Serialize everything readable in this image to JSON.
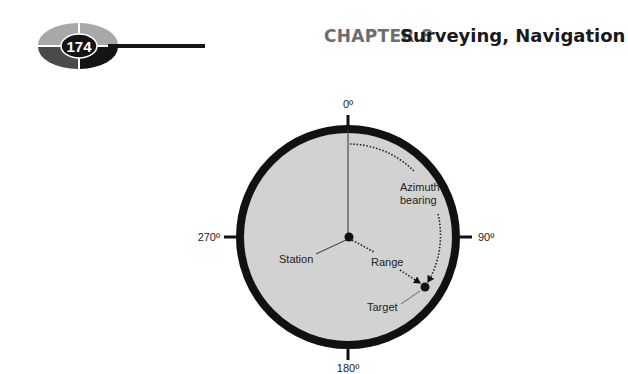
{
  "header": {
    "page_number": "174",
    "chapter_label": "CHAPTER 8",
    "chapter_title": "Surveying, Navigation"
  },
  "figure": {
    "compass_labels": {
      "north": "0º",
      "east": "90º",
      "south": "180º",
      "west": "270º"
    },
    "annotations": {
      "azimuth_line1": "Azimuth",
      "azimuth_line2": "bearing",
      "station": "Station",
      "range": "Range",
      "target": "Target"
    },
    "colors": {
      "disc_fill": "#d2d2d2",
      "rim": "#111111",
      "logo_light": "#a8a8a8",
      "logo_dark": "#4a4a4a",
      "logo_black": "#141414"
    }
  }
}
